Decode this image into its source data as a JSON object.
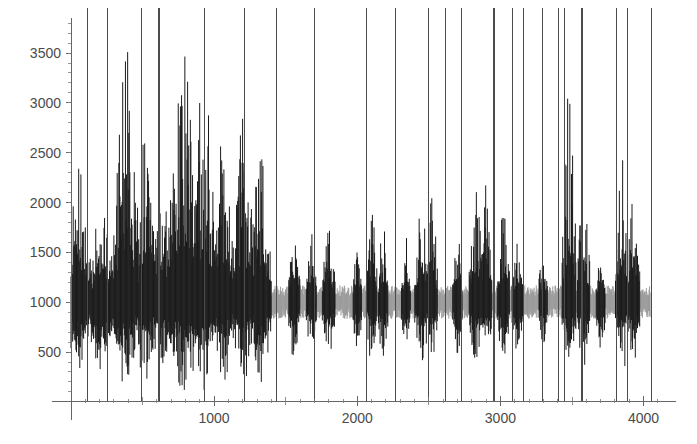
{
  "figure": {
    "title": "",
    "background_color": "#ffffff",
    "width": 697,
    "height": 444
  },
  "axes": {
    "x_axis": {
      "name": "x-axis",
      "label": "",
      "tick_labels": [
        "1000",
        "2000",
        "3000",
        "4000"
      ],
      "tick_values": [
        1000,
        2000,
        3000,
        4000
      ],
      "range": [
        0,
        4150
      ],
      "axis_color": "#666666",
      "label_color": "#4a4a4a"
    },
    "y_axis": {
      "name": "y-axis",
      "label": "",
      "tick_labels": [
        "500",
        "1000",
        "1500",
        "2000",
        "2500",
        "3000",
        "3500"
      ],
      "tick_values": [
        500,
        1000,
        1500,
        2000,
        2500,
        3000,
        3500
      ],
      "range": [
        0,
        3800
      ],
      "axis_color": "#666666",
      "label_color": "#4a4a4a"
    }
  },
  "chart_data": {
    "type": "line",
    "title": "",
    "subtitle": "",
    "xlabel": "",
    "ylabel": "",
    "xlim": [
      0,
      4150
    ],
    "ylim": [
      0,
      3800
    ],
    "grid": false,
    "legend": null,
    "legend_position": "none",
    "series": [
      {
        "name": "baseline-noise",
        "color": "#9a9a9a",
        "style": "dense-noise",
        "baseline": 1000,
        "typical_amplitude": 140,
        "x_range": [
          0,
          4050
        ]
      },
      {
        "name": "burst-activity",
        "color": "#1a1a1a",
        "style": "dense-noise",
        "baseline": 1000,
        "x_range": [
          0,
          4050
        ]
      }
    ],
    "bursts": [
      {
        "center": 60,
        "half_width": 70,
        "peak": 2250,
        "low": 430
      },
      {
        "center": 210,
        "half_width": 95,
        "peak": 1700,
        "low": 480
      },
      {
        "center": 385,
        "half_width": 105,
        "peak": 3000,
        "low": 420
      },
      {
        "center": 530,
        "half_width": 85,
        "peak": 2600,
        "low": 430
      },
      {
        "center": 640,
        "half_width": 70,
        "peak": 2150,
        "low": 470
      },
      {
        "center": 790,
        "half_width": 120,
        "peak": 3150,
        "low": 340
      },
      {
        "center": 930,
        "half_width": 90,
        "peak": 3050,
        "low": 370
      },
      {
        "center": 1060,
        "half_width": 80,
        "peak": 2450,
        "low": 430
      },
      {
        "center": 1200,
        "half_width": 85,
        "peak": 2500,
        "low": 420
      },
      {
        "center": 1320,
        "half_width": 70,
        "peak": 2350,
        "low": 470
      },
      {
        "center": 1560,
        "half_width": 45,
        "peak": 1550,
        "low": 600
      },
      {
        "center": 1680,
        "half_width": 40,
        "peak": 1500,
        "low": 620
      },
      {
        "center": 1800,
        "half_width": 50,
        "peak": 1700,
        "low": 520
      },
      {
        "center": 2000,
        "half_width": 35,
        "peak": 1450,
        "low": 630
      },
      {
        "center": 2100,
        "half_width": 45,
        "peak": 1800,
        "low": 550
      },
      {
        "center": 2180,
        "half_width": 40,
        "peak": 1600,
        "low": 560
      },
      {
        "center": 2340,
        "half_width": 35,
        "peak": 1450,
        "low": 640
      },
      {
        "center": 2450,
        "half_width": 55,
        "peak": 1850,
        "low": 520
      },
      {
        "center": 2520,
        "half_width": 45,
        "peak": 1950,
        "low": 520
      },
      {
        "center": 2700,
        "half_width": 40,
        "peak": 1500,
        "low": 610
      },
      {
        "center": 2830,
        "half_width": 55,
        "peak": 2050,
        "low": 500
      },
      {
        "center": 2900,
        "half_width": 45,
        "peak": 1900,
        "low": 540
      },
      {
        "center": 3020,
        "half_width": 50,
        "peak": 1750,
        "low": 560
      },
      {
        "center": 3120,
        "half_width": 45,
        "peak": 1500,
        "low": 600
      },
      {
        "center": 3300,
        "half_width": 35,
        "peak": 1400,
        "low": 640
      },
      {
        "center": 3480,
        "half_width": 55,
        "peak": 3050,
        "low": 400
      },
      {
        "center": 3580,
        "half_width": 50,
        "peak": 2150,
        "low": 480
      },
      {
        "center": 3700,
        "half_width": 35,
        "peak": 1350,
        "low": 660
      },
      {
        "center": 3850,
        "half_width": 55,
        "peak": 2200,
        "low": 450
      },
      {
        "center": 3930,
        "half_width": 50,
        "peak": 1900,
        "low": 500
      }
    ],
    "marker_spikes": {
      "name": "vertical-marker-lines",
      "color": "#4c4c4c",
      "extends_above_plot": true,
      "x_values": [
        118,
        258,
        495,
        615,
        930,
        1215,
        1435,
        1700,
        2065,
        2270,
        2495,
        2615,
        2730,
        2955,
        3085,
        3160,
        3295,
        3405,
        3445,
        3570,
        3810,
        3890,
        4055
      ]
    }
  }
}
